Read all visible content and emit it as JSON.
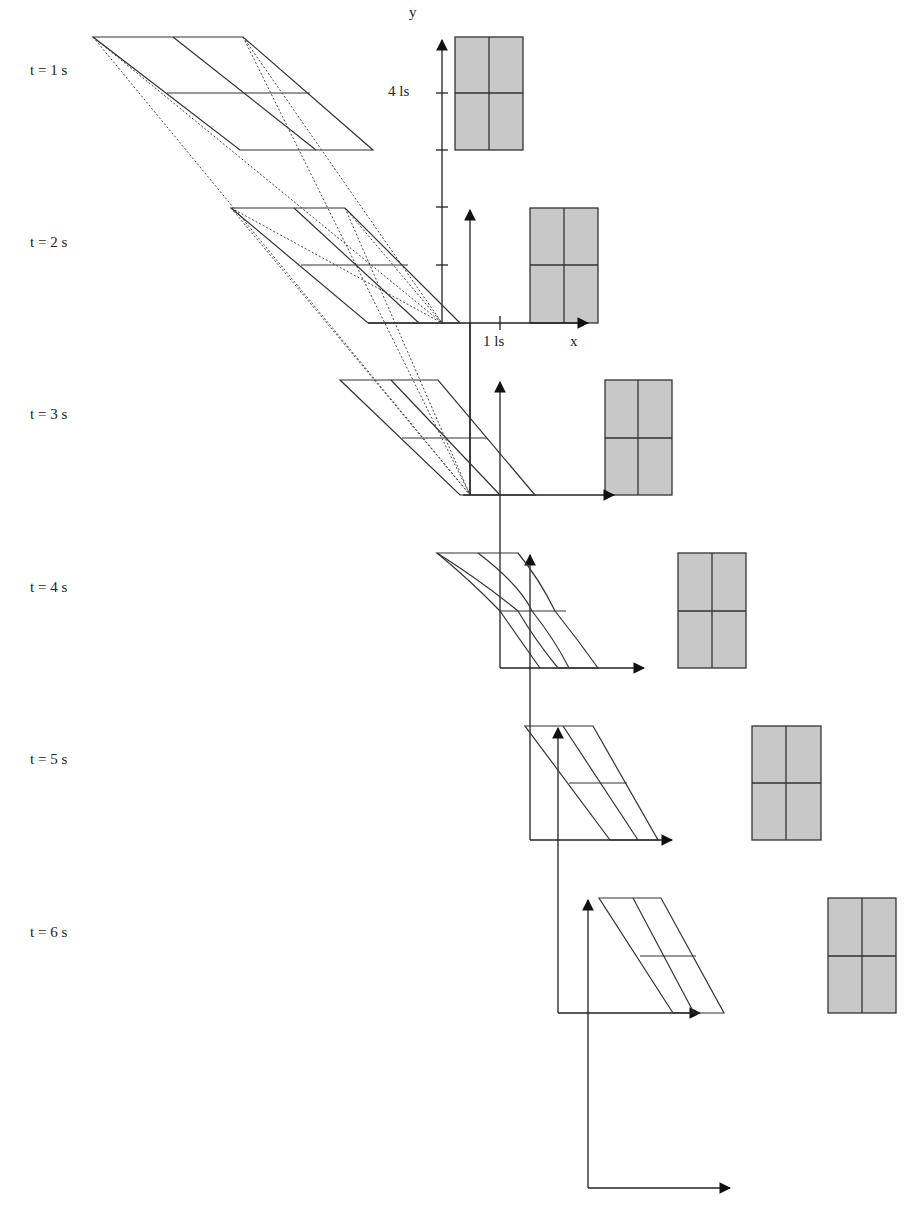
{
  "figure": {
    "colors": {
      "line": "#333333",
      "box_fill": "#c8c8c8",
      "box_stroke": "#333333",
      "background": "#ffffff"
    },
    "time_labels": [
      {
        "label": "t = 1 s",
        "y": 73
      },
      {
        "label": "t = 2 s",
        "y": 245
      },
      {
        "label": "t = 3 s",
        "y": 417
      },
      {
        "label": "t = 4 s",
        "y": 590
      },
      {
        "label": "t = 5 s",
        "y": 762
      },
      {
        "label": "t = 6 s",
        "y": 935
      }
    ],
    "axis_labels": {
      "y": "y",
      "x": "x",
      "y_tick": "4 ls",
      "x_tick": "1 ls"
    }
  }
}
